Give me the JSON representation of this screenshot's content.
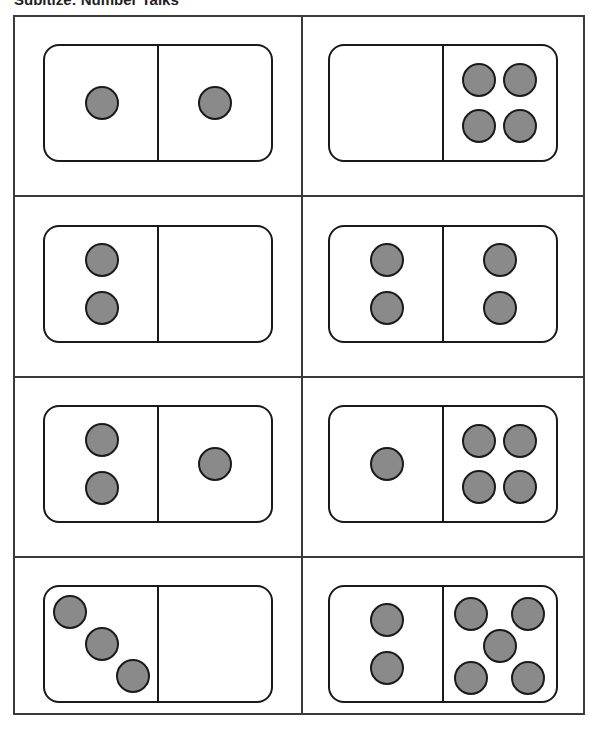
{
  "header": {
    "title": "Subitize: Number Talks"
  },
  "colors": {
    "pip_fill": "#8a8a8a",
    "outline": "#1a1a1a",
    "grid": "#3a3a3a"
  },
  "cards": [
    {
      "row": 1,
      "col": 1,
      "left": 1,
      "right": 1
    },
    {
      "row": 1,
      "col": 2,
      "left": 0,
      "right": 4
    },
    {
      "row": 2,
      "col": 1,
      "left": 2,
      "right": 0
    },
    {
      "row": 2,
      "col": 2,
      "left": 2,
      "right": 2
    },
    {
      "row": 3,
      "col": 1,
      "left": 2,
      "right": 1
    },
    {
      "row": 3,
      "col": 2,
      "left": 1,
      "right": 4
    },
    {
      "row": 4,
      "col": 1,
      "left": 3,
      "right": 0
    },
    {
      "row": 4,
      "col": 2,
      "left": 2,
      "right": 5
    }
  ]
}
